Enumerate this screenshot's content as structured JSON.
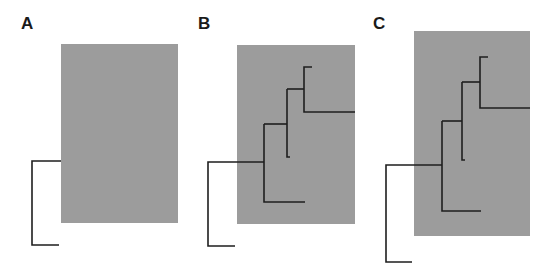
{
  "figure": {
    "panels": [
      {
        "label": "A",
        "description": "gray rectangle with single root bracket"
      },
      {
        "label": "B",
        "description": "gray rectangle with branching tree"
      },
      {
        "label": "C",
        "description": "taller gray rectangle with branching tree"
      }
    ],
    "colors": {
      "box": "#9c9c9c",
      "line": "#1e1e1e",
      "background": "#ffffff"
    }
  }
}
